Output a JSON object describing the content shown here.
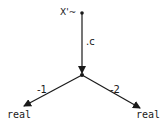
{
  "diagram": {
    "nodes": {
      "top": {
        "label": "X'~"
      },
      "left": {
        "label": "real"
      },
      "right": {
        "label": "real"
      }
    },
    "edges": [
      {
        "from": "top",
        "to": "junction",
        "label": ".c"
      },
      {
        "from": "junction",
        "to": "left",
        "label": "-1"
      },
      {
        "from": "junction",
        "to": "right",
        "label": "-2"
      }
    ],
    "colors": {
      "stroke": "#1a1a1a",
      "background": "#ffffff"
    }
  }
}
